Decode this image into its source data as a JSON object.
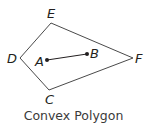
{
  "caption": "Convex Polygon",
  "colors": {
    "stroke": "#4a4a4a",
    "text": "#231f20",
    "caption": "#3a3a3a"
  },
  "polygon": {
    "vertices": [
      {
        "label": "E",
        "x": 51,
        "y": 23
      },
      {
        "label": "F",
        "x": 133,
        "y": 58
      },
      {
        "label": "C",
        "x": 49,
        "y": 90
      },
      {
        "label": "D",
        "x": 20,
        "y": 58
      }
    ]
  },
  "segment": {
    "points": [
      {
        "label": "A",
        "x": 47,
        "y": 60
      },
      {
        "label": "B",
        "x": 87,
        "y": 54
      }
    ]
  },
  "labels": {
    "E": "E",
    "F": "F",
    "C": "C",
    "D": "D",
    "A": "A",
    "B": "B"
  }
}
